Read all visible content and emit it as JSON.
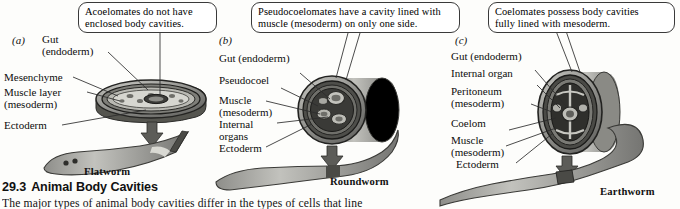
{
  "figure": {
    "caption_number": "29.3",
    "caption_title": "Animal Body Cavities",
    "caption_body": "The major types of animal body cavities differ in the types of cells that line"
  },
  "panels": [
    {
      "letter": "(a)",
      "organism": "Flatworm",
      "callout": [
        "Acoelomates do not have",
        "enclosed body cavities."
      ],
      "labels": [
        {
          "name": "gut",
          "lines": [
            "Gut",
            "(endoderm)"
          ]
        },
        {
          "name": "mesenchyme",
          "lines": [
            "Mesenchyme"
          ]
        },
        {
          "name": "muscle-layer",
          "lines": [
            "Muscle layer",
            "(mesoderm)"
          ]
        },
        {
          "name": "ectoderm",
          "lines": [
            "Ectoderm"
          ]
        }
      ]
    },
    {
      "letter": "(b)",
      "organism": "Roundworm",
      "callout": [
        "Pseudocoelomates have a cavity lined with",
        "muscle (mesoderm) on only one side."
      ],
      "labels": [
        {
          "name": "gut",
          "lines": [
            "Gut (endoderm)"
          ]
        },
        {
          "name": "pseudocoel",
          "lines": [
            "Pseudocoel"
          ]
        },
        {
          "name": "muscle",
          "lines": [
            "Muscle",
            "(mesoderm)"
          ]
        },
        {
          "name": "internal-organs",
          "lines": [
            "Internal",
            "organs"
          ]
        },
        {
          "name": "ectoderm",
          "lines": [
            "Ectoderm"
          ]
        }
      ]
    },
    {
      "letter": "(c)",
      "organism": "Earthworm",
      "callout": [
        "Coelomates possess body cavities",
        "fully lined with mesoderm."
      ],
      "labels": [
        {
          "name": "gut",
          "lines": [
            "Gut (endoderm)"
          ]
        },
        {
          "name": "internal-organ",
          "lines": [
            "Internal organ"
          ]
        },
        {
          "name": "peritoneum",
          "lines": [
            "Peritoneum",
            "(mesoderm)"
          ]
        },
        {
          "name": "coelom",
          "lines": [
            "Coelom"
          ]
        },
        {
          "name": "muscle",
          "lines": [
            "Muscle",
            "(mesoderm)"
          ]
        },
        {
          "name": "ectoderm",
          "lines": [
            "Ectoderm"
          ]
        }
      ]
    }
  ],
  "colors": {
    "ink": "#111111",
    "callout_border": "#3a3a3a",
    "body_gray": "#9a9a97",
    "body_gray_dark": "#5e5e5c",
    "body_gray_light": "#c9c9c4",
    "page": "#fdfdfb"
  }
}
